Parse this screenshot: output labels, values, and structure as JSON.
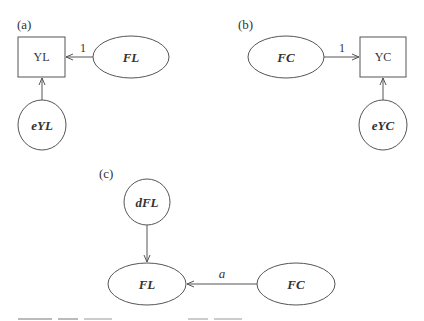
{
  "panels": {
    "a": {
      "label": "(a)",
      "observed": "YL",
      "factor": "FL",
      "error": "eYL",
      "loading": "1"
    },
    "b": {
      "label": "(b)",
      "observed": "YC",
      "factor": "FC",
      "error": "eYC",
      "loading": "1"
    },
    "c": {
      "label": "(c)",
      "disturbance": "dFL",
      "outcome_factor": "FL",
      "predictor_factor": "FC",
      "path": "a"
    }
  },
  "colors": {
    "stroke": "#555555",
    "text": "#333333",
    "background": "#ffffff"
  }
}
